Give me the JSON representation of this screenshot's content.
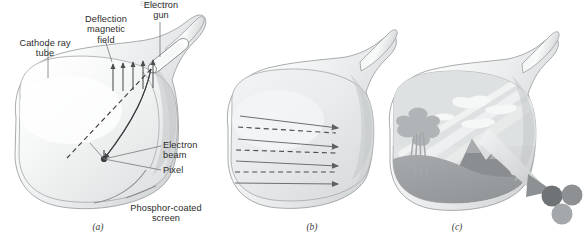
{
  "figure": {
    "title_fragment_top": "Electron",
    "panels": [
      {
        "id": "a",
        "caption": "(a)",
        "name": "crt-cutaway-panel",
        "labels": [
          {
            "key": "cathode_ray_tube",
            "text": "Cathode ray\ntube"
          },
          {
            "key": "deflection_magnetic_field",
            "text": "Deflection\nmagnetic\nfield"
          },
          {
            "key": "electron_gun",
            "text": "Electron\ngun"
          },
          {
            "key": "electron_beam",
            "text": "Electron\nbeam"
          },
          {
            "key": "pixel",
            "text": "Pixel"
          },
          {
            "key": "phosphor_coated_screen",
            "text": "Phosphor-coated\nscreen"
          }
        ]
      },
      {
        "id": "b",
        "caption": "(b)",
        "name": "raster-scan-panel",
        "scan_line_count": 4,
        "labels": []
      },
      {
        "id": "c",
        "caption": "(c)",
        "name": "displayed-image-panel",
        "phosphor_dot_count": 3,
        "labels": []
      }
    ],
    "colors": {
      "ink": "#2b2b2b",
      "outline": "#8a8d90",
      "tube_light": "#fbfbfb",
      "tube_mid": "#e3e5e6",
      "tube_shade": "#c9cccd",
      "arrow": "#6d7073",
      "scene_sky": "#e0e2e3",
      "scene_ground": "#9ca0a2",
      "scene_tree": "#b4b8b9",
      "dot_dark": "#6f7375",
      "dot_mid": "#8d9193",
      "dot_light": "#a4a8aa"
    }
  }
}
